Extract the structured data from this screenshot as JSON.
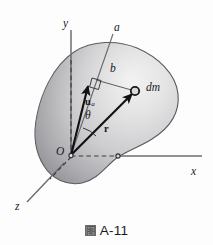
{
  "figure": {
    "kind": "mechanics-diagram",
    "background_color": "#fdfdfd",
    "body_fill_light": "#f2f2f2",
    "body_fill_mid": "#c6c6c8",
    "body_fill_dark": "#8e8e92",
    "outline_color": "#4a4a4e",
    "vector_color": "#111113",
    "axis_color": "#6e6e72"
  },
  "axes": [
    {
      "id": "y",
      "label": "y",
      "x": 66,
      "y": 23
    },
    {
      "id": "a",
      "label": "a",
      "x": 117,
      "y": 27
    },
    {
      "id": "x",
      "label": "x",
      "x": 193,
      "y": 172
    },
    {
      "id": "z",
      "label": "z",
      "x": 17,
      "y": 207
    }
  ],
  "labels": [
    {
      "id": "origin",
      "text": "O",
      "x": 59,
      "y": 152,
      "style": "italic"
    },
    {
      "id": "b-distance",
      "text": "b",
      "x": 113,
      "y": 70,
      "style": "italic"
    },
    {
      "id": "dm-element",
      "text": "dm",
      "x": 148,
      "y": 89,
      "style": "italic"
    },
    {
      "id": "theta-angle",
      "text": "θ",
      "x": 88,
      "y": 117,
      "style": "italic"
    },
    {
      "id": "r-vector",
      "text": "r",
      "x": 107,
      "y": 131,
      "style": "bold"
    },
    {
      "id": "u-vector",
      "text": "u",
      "sub": "a",
      "x": 89,
      "y": 99,
      "style": "bold"
    }
  ],
  "points": [
    {
      "id": "origin-point",
      "x": 71,
      "y": 155
    },
    {
      "id": "dm-point",
      "x": 135,
      "y": 91
    },
    {
      "id": "x-foot-point",
      "x": 118,
      "y": 156
    }
  ],
  "caption": {
    "glyph": "图",
    "glyph_name": "cjk-figure-glyph",
    "text": "A-11"
  }
}
